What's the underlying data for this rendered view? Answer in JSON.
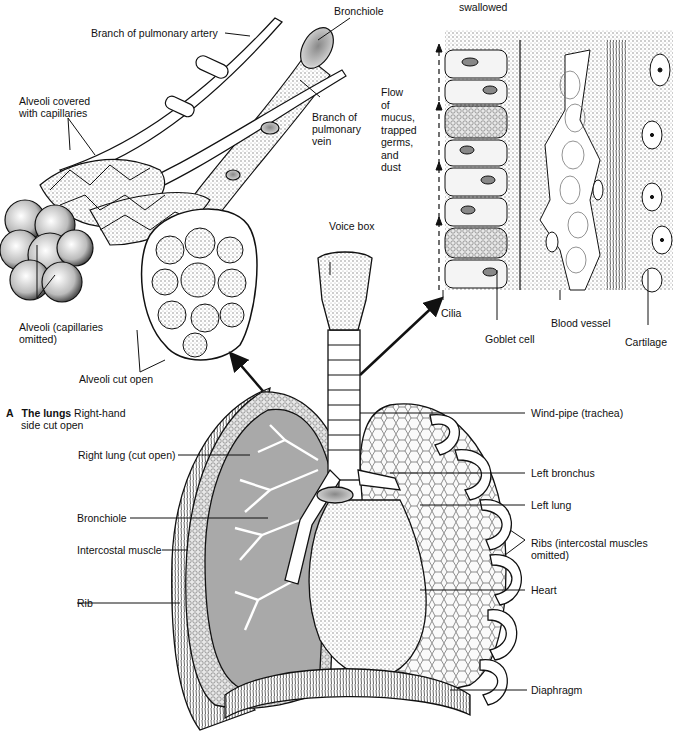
{
  "figure": {
    "caption": {
      "letter": "A",
      "title": "The lungs",
      "subtitle_line1": "Right-hand",
      "subtitle_line2": "side cut open"
    },
    "top_right_partial_text": "swallowed"
  },
  "labels": {
    "branch_pulmonary_artery": "Branch of pulmonary artery",
    "bronchiole_top": "Bronchiole",
    "alveoli_covered_l1": "Alveoli covered",
    "alveoli_covered_l2": "with capillaries",
    "branch_pulmonary_vein_l1": "Branch of",
    "branch_pulmonary_vein_l2": "pulmonary",
    "branch_pulmonary_vein_l3": "vein",
    "flow_l1": "Flow",
    "flow_l2": "of",
    "flow_l3": "mucus,",
    "flow_l4": "trapped",
    "flow_l5": "germs,",
    "flow_l6": "and",
    "flow_l7": "dust",
    "alveoli_omitted_l1": "Alveoli (capillaries",
    "alveoli_omitted_l2": "omitted)",
    "alveoli_cut_open": "Alveoli cut open",
    "voice_box": "Voice box",
    "cilia": "Cilia",
    "goblet_cell": "Goblet cell",
    "blood_vessel": "Blood vessel",
    "cartilage": "Cartilage",
    "right_lung": "Right lung (cut open)",
    "bronchiole": "Bronchiole",
    "intercostal_muscle": "Intercostal muscle",
    "rib": "Rib",
    "windpipe": "Wind-pipe (trachea)",
    "left_bronchus": "Left bronchus",
    "left_lung": "Left lung",
    "ribs_omitted_l1": "Ribs (intercostal muscles",
    "ribs_omitted_l2": "omitted)",
    "heart": "Heart",
    "diaphragm": "Diaphragm"
  },
  "colors": {
    "ink": "#111111",
    "lung_cut_fill": "#a9a9a9",
    "tissue_fill": "#d6d6d6",
    "paper": "#ffffff"
  }
}
